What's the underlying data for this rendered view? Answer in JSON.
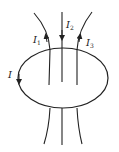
{
  "diagram": {
    "loop_label": "I",
    "currents": [
      {
        "label": "I",
        "sub": "1",
        "direction": "up"
      },
      {
        "label": "I",
        "sub": "2",
        "direction": "down"
      },
      {
        "label": "I",
        "sub": "3",
        "direction": "up"
      }
    ],
    "colors": {
      "stroke": "#222222",
      "background": "#ffffff"
    }
  }
}
